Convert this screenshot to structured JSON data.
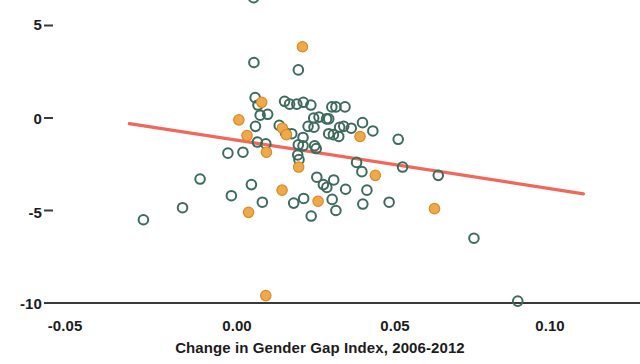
{
  "chart_data": {
    "type": "scatter",
    "title": "",
    "subtitle": "",
    "xlabel": "Change in Gender Gap Index, 2006-2012",
    "ylabel": "",
    "xlim": [
      -0.0554,
      0.1024
    ],
    "ylim": [
      -10.95,
      6.6
    ],
    "grid": false,
    "legend_position": "none",
    "xticks": [
      -0.05,
      0.0,
      0.05,
      0.1
    ],
    "xtick_labels": [
      "-0.05",
      "0.00",
      "0.05",
      "0.10"
    ],
    "yticks": [
      5,
      0,
      -5,
      -10
    ],
    "ytick_labels": [
      "5",
      "0",
      "-5",
      "-10"
    ],
    "colors": {
      "open_marker_edge": "#3d6b5d",
      "filled_marker_face": "#efa948",
      "filled_marker_edge": "#d98a2b",
      "trendline": "#f2675a",
      "axis": "#3a3a3a",
      "text": "#1c1c1c",
      "background": "#ffffff"
    },
    "series": [
      {
        "name": "open",
        "marker": "open-circle",
        "points": [
          [
            0.0053,
            6.5
          ],
          [
            0.0054,
            3.0
          ],
          [
            0.0196,
            2.6
          ],
          [
            0.0058,
            1.1
          ],
          [
            0.0067,
            0.7
          ],
          [
            0.0152,
            0.9
          ],
          [
            0.0168,
            0.75
          ],
          [
            0.0191,
            0.75
          ],
          [
            0.0212,
            0.85
          ],
          [
            0.0236,
            0.7
          ],
          [
            0.0303,
            0.6
          ],
          [
            0.0316,
            0.6
          ],
          [
            0.0345,
            0.6
          ],
          [
            0.0074,
            0.15
          ],
          [
            0.0098,
            0.2
          ],
          [
            0.0245,
            0.0
          ],
          [
            0.0262,
            0.05
          ],
          [
            0.0286,
            -0.05
          ],
          [
            0.0293,
            -0.05
          ],
          [
            0.0401,
            -0.25
          ],
          [
            0.0059,
            -0.45
          ],
          [
            0.0135,
            -0.4
          ],
          [
            0.0227,
            -0.45
          ],
          [
            0.0246,
            -0.5
          ],
          [
            0.0328,
            -0.5
          ],
          [
            0.0341,
            -0.45
          ],
          [
            0.0365,
            -0.55
          ],
          [
            0.0434,
            -0.7
          ],
          [
            0.0155,
            -0.8
          ],
          [
            0.0175,
            -0.85
          ],
          [
            0.0293,
            -0.85
          ],
          [
            0.0308,
            -0.9
          ],
          [
            0.0325,
            -1.0
          ],
          [
            0.0211,
            -1.05
          ],
          [
            0.0515,
            -1.15
          ],
          [
            0.0065,
            -1.3
          ],
          [
            0.0092,
            -1.4
          ],
          [
            0.0196,
            -1.45
          ],
          [
            0.0211,
            -1.5
          ],
          [
            0.0248,
            -1.5
          ],
          [
            0.0253,
            -1.65
          ],
          [
            0.0019,
            -1.85
          ],
          [
            -0.0029,
            -1.9
          ],
          [
            0.0194,
            -2.0
          ],
          [
            0.0198,
            -2.25
          ],
          [
            0.0382,
            -2.4
          ],
          [
            0.0399,
            -2.9
          ],
          [
            0.0529,
            -2.65
          ],
          [
            0.0255,
            -3.2
          ],
          [
            0.0309,
            -3.35
          ],
          [
            0.0643,
            -3.1
          ],
          [
            -0.0118,
            -3.3
          ],
          [
            0.0046,
            -3.6
          ],
          [
            0.0276,
            -3.6
          ],
          [
            0.0287,
            -3.75
          ],
          [
            0.0347,
            -3.85
          ],
          [
            0.0415,
            -3.9
          ],
          [
            -0.0018,
            -4.2
          ],
          [
            0.0213,
            -4.35
          ],
          [
            0.0304,
            -4.4
          ],
          [
            0.0081,
            -4.55
          ],
          [
            0.0181,
            -4.6
          ],
          [
            0.0402,
            -4.65
          ],
          [
            0.0486,
            -4.55
          ],
          [
            -0.0174,
            -4.85
          ],
          [
            0.0316,
            -5.0
          ],
          [
            0.0237,
            -5.3
          ],
          [
            -0.0299,
            -5.5
          ],
          [
            0.0757,
            -6.5
          ],
          [
            0.0897,
            -9.9
          ]
        ]
      },
      {
        "name": "filled",
        "marker": "filled-circle",
        "points": [
          [
            0.0209,
            3.85
          ],
          [
            0.0079,
            0.85
          ],
          [
            0.0006,
            -0.1
          ],
          [
            0.0145,
            -0.55
          ],
          [
            0.0158,
            -0.9
          ],
          [
            0.0032,
            -0.95
          ],
          [
            0.0393,
            -1.0
          ],
          [
            0.0094,
            -1.85
          ],
          [
            0.0197,
            -2.65
          ],
          [
            0.0442,
            -3.1
          ],
          [
            0.0144,
            -3.9
          ],
          [
            0.0259,
            -4.5
          ],
          [
            0.0037,
            -5.1
          ],
          [
            0.0631,
            -4.9
          ],
          [
            0.0092,
            -9.6
          ]
        ]
      }
    ],
    "trendline": {
      "x_start": -0.0344,
      "y_start": -0.3,
      "x_end": 0.1107,
      "y_end": -4.1
    }
  }
}
